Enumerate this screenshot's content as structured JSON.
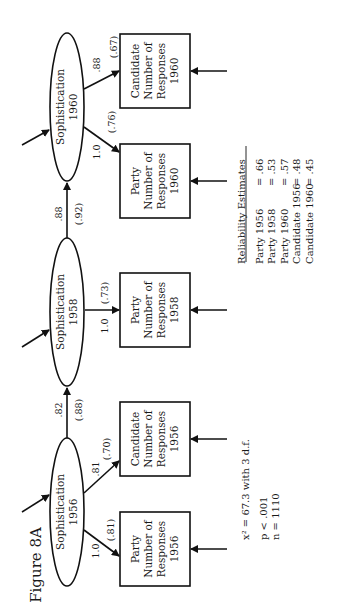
{
  "figure": {
    "title": "Figure 8A"
  },
  "latent_nodes": [
    {
      "id": "soph1956",
      "label": "Sophistication",
      "year": "1956"
    },
    {
      "id": "soph1958",
      "label": "Sophistication",
      "year": "1958"
    },
    {
      "id": "soph1960",
      "label": "Sophistication",
      "year": "1960"
    }
  ],
  "indicator_nodes": [
    {
      "id": "party1956",
      "line1": "Party",
      "line2": "Number of",
      "line3": "Responses",
      "year": "1956"
    },
    {
      "id": "cand1956",
      "line1": "Candidate",
      "line2": "Number of",
      "line3": "Responses",
      "year": "1956"
    },
    {
      "id": "party1958",
      "line1": "Party",
      "line2": "Number of",
      "line3": "Responses",
      "year": "1958"
    },
    {
      "id": "party1960",
      "line1": "Party",
      "line2": "Number of",
      "line3": "Responses",
      "year": "1960"
    },
    {
      "id": "cand1960",
      "line1": "Candidate",
      "line2": "Number of",
      "line3": "Responses",
      "year": "1960"
    }
  ],
  "paths": {
    "soph1956_party1956": {
      "coef": "1.0",
      "std": "(.81)"
    },
    "soph1956_cand1956": {
      "coef": ".81",
      "std": "(.70)"
    },
    "soph1956_soph1958": {
      "coef": ".82",
      "std": "(.88)"
    },
    "soph1958_party1958": {
      "coef": "1.0",
      "std": "(.73)"
    },
    "soph1958_soph1960": {
      "coef": ".88",
      "std": "(.92)"
    },
    "soph1960_party1960": {
      "coef": "1.0",
      "std": "(.76)"
    },
    "soph1960_cand1960": {
      "coef": ".88",
      "std": "(.67)"
    }
  },
  "fit_stats": {
    "chi_square": "x² = 67.3 with 3 d.f.",
    "p": "p  <  .001",
    "n": "n  =  1110"
  },
  "reliability": {
    "heading": "Reliability Estimates",
    "rows": [
      {
        "name": "Party 1956",
        "value": "= .66"
      },
      {
        "name": "Party 1958",
        "value": "= .53"
      },
      {
        "name": "Party 1960",
        "value": "= .57"
      },
      {
        "name": "Candidate 1956",
        "value": "= .48"
      },
      {
        "name": "Candidate 1960",
        "value": "= .45"
      }
    ]
  }
}
